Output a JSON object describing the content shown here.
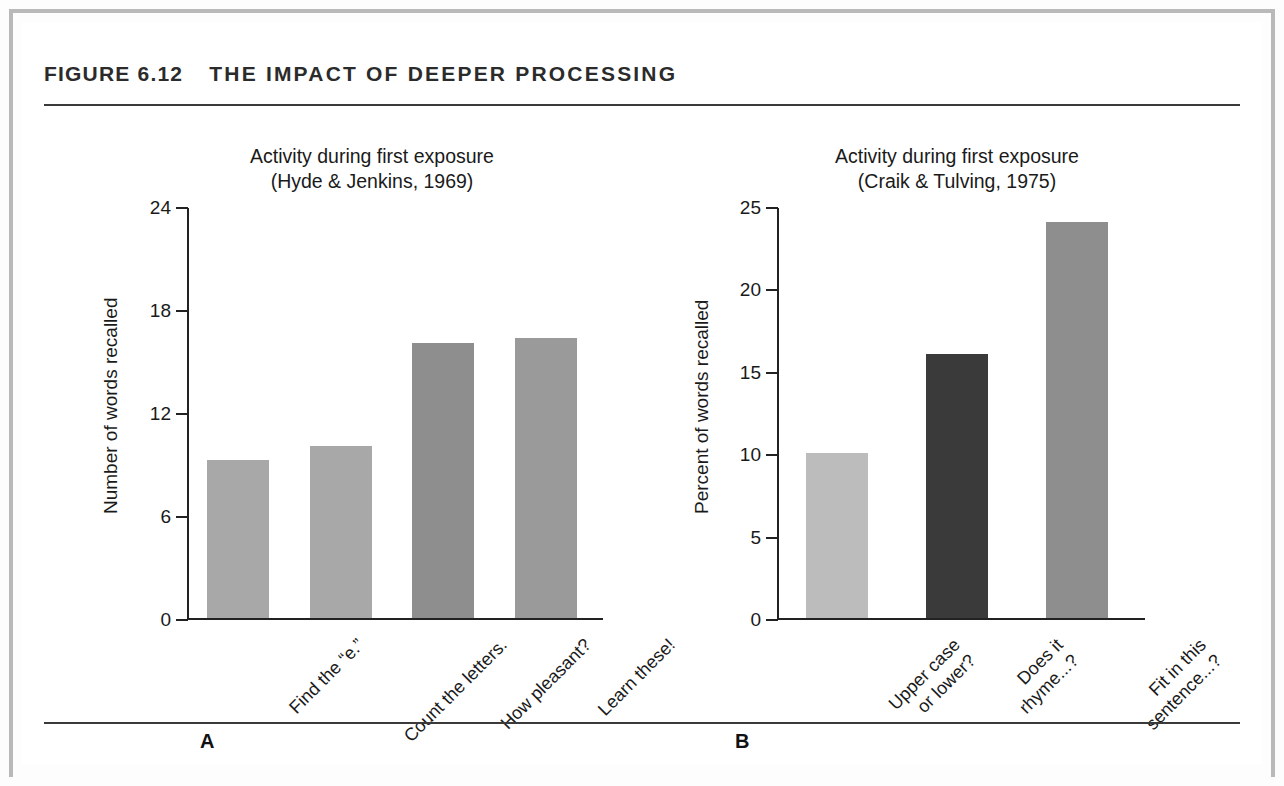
{
  "figure": {
    "number": "FIGURE 6.12",
    "title": "THE IMPACT OF DEEPER PROCESSING"
  },
  "panels": [
    {
      "letter": "A",
      "title_line1": "Activity during first exposure",
      "title_line2": "(Hyde & Jenkins, 1969)"
    },
    {
      "letter": "B",
      "title_line1": "Activity during first exposure",
      "title_line2": "(Craik & Tulving, 1975)"
    }
  ],
  "chart_data": [
    {
      "type": "bar",
      "panel": "A",
      "title": "Activity during first exposure (Hyde & Jenkins, 1969)",
      "xlabel": "",
      "ylabel": "Number of words recalled",
      "ylim": [
        0,
        24
      ],
      "yticks": [
        "0",
        "6",
        "12",
        "18",
        "24"
      ],
      "ytick_values": [
        0,
        6,
        12,
        18,
        24
      ],
      "grid": false,
      "legend": "none",
      "categories": [
        "Find the “e.”",
        "Count the letters.",
        "How pleasant?",
        "Learn these!"
      ],
      "category_lines": [
        [
          "Find the “e.”"
        ],
        [
          "Count the letters."
        ],
        [
          "How pleasant?"
        ],
        [
          "Learn these!"
        ]
      ],
      "values": [
        9.2,
        10,
        16,
        16.3
      ],
      "bar_colors": [
        "#a8a8a8",
        "#a8a8a8",
        "#8e8e8e",
        "#9a9a9a"
      ]
    },
    {
      "type": "bar",
      "panel": "B",
      "title": "Activity during first exposure (Craik & Tulving, 1975)",
      "xlabel": "",
      "ylabel": "Percent of words recalled",
      "ylim": [
        0,
        25
      ],
      "yticks": [
        "0",
        "5",
        "10",
        "15",
        "20",
        "25"
      ],
      "ytick_values": [
        0,
        5,
        10,
        15,
        20,
        25
      ],
      "grid": false,
      "legend": "none",
      "categories": [
        "Upper case or lower?",
        "Does it rhyme...?",
        "Fit in this sentence...?"
      ],
      "category_lines": [
        [
          "Upper case",
          "or lower?"
        ],
        [
          "Does it",
          "rhyme...?"
        ],
        [
          "Fit in this",
          "sentence...?"
        ]
      ],
      "values": [
        10,
        16,
        24
      ],
      "bar_colors": [
        "#bcbcbc",
        "#3a3a3a",
        "#8e8e8e"
      ]
    }
  ],
  "colors": {
    "axis": "#222222",
    "rule": "#3a3a3a",
    "page_border": "#b9b9b9",
    "text": "#1a1a1a"
  }
}
